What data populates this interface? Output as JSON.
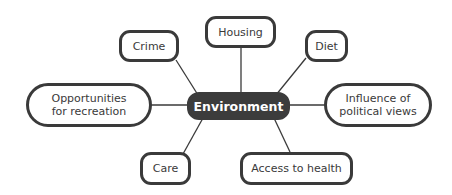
{
  "diagram": {
    "type": "mind-map",
    "center": {
      "label": "Environment"
    },
    "nodes": [
      {
        "id": "crime",
        "label": "Crime"
      },
      {
        "id": "housing",
        "label": "Housing"
      },
      {
        "id": "diet",
        "label": "Diet"
      },
      {
        "id": "recreation",
        "label": "Opportunities for recreation"
      },
      {
        "id": "political",
        "label": "Influence of political views"
      },
      {
        "id": "care",
        "label": "Care"
      },
      {
        "id": "health",
        "label": "Access to health"
      }
    ],
    "colors": {
      "line": "#3a3a3a",
      "center_fill": "#3c3c3c",
      "node_fill": "#ffffff"
    }
  }
}
